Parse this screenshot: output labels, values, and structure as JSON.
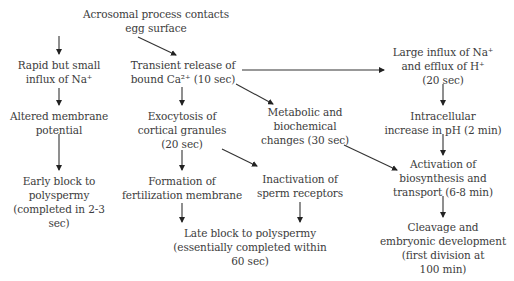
{
  "diagram": {
    "nodes": {
      "start": {
        "lines": [
          "Acrosomal process contacts",
          "egg surface"
        ]
      },
      "na_small": {
        "lines": [
          "Rapid but small",
          "influx of Na⁺"
        ]
      },
      "ca_release": {
        "lines": [
          "Transient release of",
          "bound Ca²⁺ (10 sec)"
        ]
      },
      "na_large": {
        "lines": [
          "Large influx of Na⁺",
          "and efflux of H⁺",
          "(20 sec)"
        ]
      },
      "membrane": {
        "lines": [
          "Altered membrane",
          "potential"
        ]
      },
      "exocytosis": {
        "lines": [
          "Exocytosis of",
          "cortical granules",
          "(20 sec)"
        ]
      },
      "metabolic": {
        "lines": [
          "Metabolic and",
          "biochemical",
          "changes (30 sec)"
        ]
      },
      "ph": {
        "lines": [
          "Intracellular",
          "increase in pH (2 min)"
        ]
      },
      "early_block": {
        "lines": [
          "Early block to",
          "polyspermy",
          "(completed in 2-3",
          "sec)"
        ]
      },
      "fert_membrane": {
        "lines": [
          "Formation of",
          "fertilization membrane"
        ]
      },
      "inactivation": {
        "lines": [
          "Inactivation of",
          "sperm receptors"
        ]
      },
      "biosynthesis": {
        "lines": [
          "Activation of",
          "biosynthesis and",
          "transport (6-8 min)"
        ]
      },
      "late_block": {
        "lines": [
          "Late block to polyspermy",
          "(essentially completed within",
          "60 sec)"
        ]
      },
      "cleavage": {
        "lines": [
          "Cleavage and",
          "embryonic development",
          "(first division at",
          "100 min)"
        ]
      }
    },
    "edges": [
      {
        "from": "start",
        "to": "na_small"
      },
      {
        "from": "start",
        "to": "ca_release"
      },
      {
        "from": "ca_release",
        "to": "na_large"
      },
      {
        "from": "ca_release",
        "to": "exocytosis"
      },
      {
        "from": "ca_release",
        "to": "metabolic"
      },
      {
        "from": "na_small",
        "to": "membrane"
      },
      {
        "from": "membrane",
        "to": "early_block"
      },
      {
        "from": "exocytosis",
        "to": "fert_membrane"
      },
      {
        "from": "exocytosis",
        "to": "inactivation"
      },
      {
        "from": "fert_membrane",
        "to": "late_block"
      },
      {
        "from": "inactivation",
        "to": "late_block"
      },
      {
        "from": "metabolic",
        "to": "biosynthesis"
      },
      {
        "from": "na_large",
        "to": "ph"
      },
      {
        "from": "ph",
        "to": "biosynthesis"
      },
      {
        "from": "biosynthesis",
        "to": "cleavage"
      }
    ]
  }
}
